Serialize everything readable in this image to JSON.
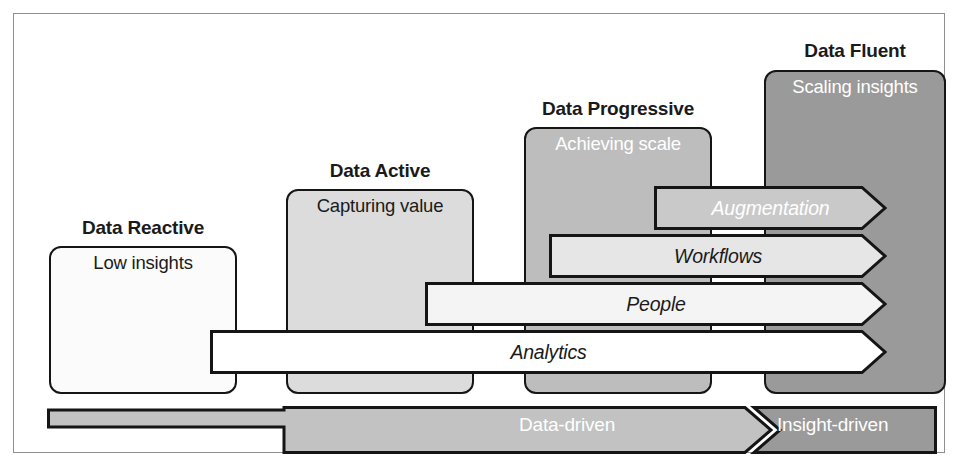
{
  "figure": {
    "type": "staircase-diagram"
  },
  "stages": [
    {
      "id": "data-reactive",
      "label": "Data Reactive",
      "subtitle": "Low insights",
      "fill": "#fbfbfb",
      "text_color": "#1a1a1a"
    },
    {
      "id": "data-active",
      "label": "Data Active",
      "subtitle": "Capturing value",
      "fill": "#dcdcdc",
      "text_color": "#1a1a1a"
    },
    {
      "id": "data-progressive",
      "label": "Data Progressive",
      "subtitle": "Achieving scale",
      "fill": "#bdbdbd",
      "text_color": "#ffffff"
    },
    {
      "id": "data-fluent",
      "label": "Data Fluent",
      "subtitle": "Scaling insights",
      "fill": "#9a9a9a",
      "text_color": "#ffffff"
    }
  ],
  "capabilities": [
    {
      "id": "augmentation",
      "label": "Augmentation",
      "fill": "#c9c9c9",
      "text_color": "#ffffff",
      "starts_at_stage": "data-progressive"
    },
    {
      "id": "workflows",
      "label": "Workflows",
      "fill": "#e6e6e6",
      "text_color": "#1a1a1a",
      "starts_at_stage": "data-progressive"
    },
    {
      "id": "people",
      "label": "People",
      "fill": "#f4f4f4",
      "text_color": "#1a1a1a",
      "starts_at_stage": "data-active"
    },
    {
      "id": "analytics",
      "label": "Analytics",
      "fill": "#ffffff",
      "text_color": "#1a1a1a",
      "starts_at_stage": "data-reactive"
    }
  ],
  "driven_bar": {
    "segments": [
      {
        "id": "data-driven",
        "label": "Data-driven",
        "fill": "#c2c2c2",
        "text_color": "#ffffff"
      },
      {
        "id": "insight-driven",
        "label": "Insight-driven",
        "fill": "#9a9a9a",
        "text_color": "#ffffff"
      }
    ]
  },
  "colors": {
    "outline": "#151515",
    "frame": "#8f8f8f",
    "background": "#ffffff"
  }
}
